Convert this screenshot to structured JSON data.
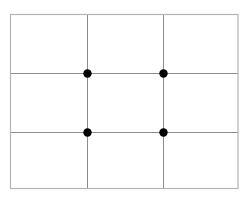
{
  "diagram": {
    "type": "rule-of-thirds-grid",
    "frame": {
      "x": 10.5,
      "y": 14.5,
      "width": 227.5,
      "height": 174
    },
    "vertical_lines_x": [
      87,
      163
    ],
    "horizontal_lines_y": [
      73,
      132
    ],
    "intersection_points": [
      {
        "x": 87,
        "y": 73
      },
      {
        "x": 163,
        "y": 73
      },
      {
        "x": 87,
        "y": 132
      },
      {
        "x": 163,
        "y": 132
      }
    ],
    "point_radius": 4.2,
    "colors": {
      "background": "#ffffff",
      "frame_stroke": "#b4b4b4",
      "grid_stroke": "#8c8c8c",
      "point_fill": "#000000"
    }
  }
}
